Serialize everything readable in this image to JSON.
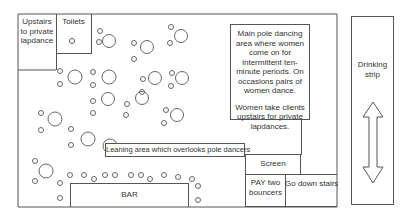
{
  "diagram": {
    "labels": {
      "upstairs": "Upstairs to private lapdance",
      "toilets": "Toilets",
      "main_area_p1": "Main pole dancing area where women come on for intermittent ten-minute periods. On occasions pairs of women dance.",
      "main_area_p2": "Women take clients upstairs for private lapdances.",
      "drinking_strip": "Drinking strip",
      "leaning_area": "Leaning area which overlooks pole dancers",
      "screen": "Screen",
      "pay": "PAY two bouncers",
      "stairs": "Go down stairs",
      "bar": "BAR"
    },
    "icons": {
      "tables": "table-circle-icon",
      "stools": "stool-circle-icon",
      "arrow": "double-arrow-vertical-icon"
    },
    "colors": {
      "line": "#555555",
      "text": "#333333",
      "background": "#ffffff"
    }
  }
}
